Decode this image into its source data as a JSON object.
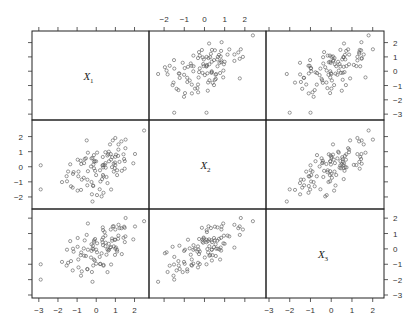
{
  "chart_data": {
    "type": "scatter",
    "subtype": "scatterplot-matrix",
    "title": "",
    "variables": [
      {
        "name": "X1",
        "label": "X",
        "subscript": "1"
      },
      {
        "name": "X2",
        "label": "X",
        "subscript": "2"
      },
      {
        "name": "X3",
        "label": "X",
        "subscript": "3"
      }
    ],
    "layout": {
      "rows": 3,
      "cols": 3,
      "diagonal": "variable-names",
      "grid": false,
      "legend": "none"
    },
    "axes": {
      "X1": {
        "range": [
          -3.2,
          2.6
        ],
        "ticks": [
          -3,
          -2,
          -1,
          0,
          1,
          2
        ]
      },
      "X2": {
        "range": [
          -2.6,
          2.9
        ],
        "ticks": [
          -2,
          -1,
          0,
          1,
          2
        ]
      },
      "X3": {
        "range": [
          -3.0,
          2.4
        ],
        "ticks": [
          -3,
          -2,
          -1,
          0,
          1,
          2
        ]
      }
    },
    "tick_label_placement": {
      "bottom_col1": [
        "-3",
        "-2",
        "-1",
        "0",
        "1",
        "2"
      ],
      "top_col2": [
        "-2",
        "-1",
        "0",
        "1",
        "2"
      ],
      "bottom_col3": [
        "-3",
        "-2",
        "-1",
        "0",
        "1",
        "2"
      ],
      "left_row2": [
        "2",
        "1",
        "0",
        "-1",
        "-2"
      ],
      "right_row1": [
        "2",
        "1",
        "0",
        "-1",
        "-2",
        "-3"
      ],
      "right_row3": [
        "2",
        "1",
        "0",
        "-1",
        "-2",
        "-3"
      ]
    },
    "n_points": 100,
    "correlations_estimated": {
      "X1_X2": 0.45,
      "X1_X3": 0.6,
      "X2_X3": 0.7
    },
    "outliers_visible": [
      {
        "X1": -2.9,
        "X2": 0.1,
        "X3": -1.0
      },
      {
        "X1": -2.9,
        "X2": -1.5,
        "X3": -2.0
      },
      {
        "X1": 2.5,
        "X2": 2.4,
        "X3": 1.8
      }
    ],
    "marker": "open-circle",
    "colors": {
      "points": "#555555",
      "frame": "#222222",
      "text": "#333333"
    }
  }
}
